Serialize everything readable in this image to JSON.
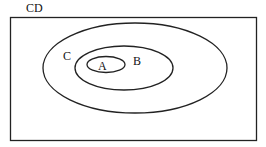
{
  "diagram": {
    "type": "euler",
    "universe_label": "CD",
    "sets": [
      {
        "label": "C",
        "contains": [
          "B"
        ]
      },
      {
        "label": "B",
        "contains": [
          "A"
        ]
      },
      {
        "label": "A",
        "contains": []
      }
    ]
  }
}
